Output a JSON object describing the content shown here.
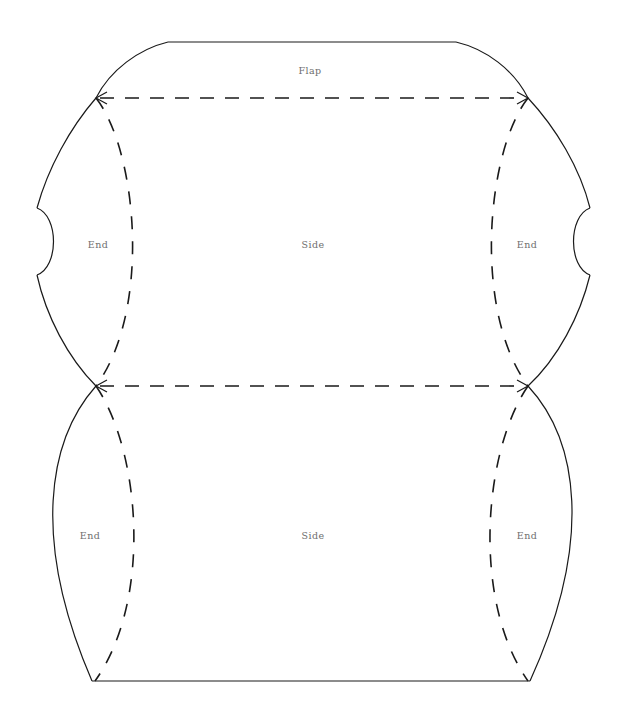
{
  "document": {
    "title": "Pillow Box Die-Cut Template",
    "background_color": "#ffffff",
    "cut_line_color": "#1a1a1a",
    "fold_line_color": "#1a1a1a",
    "label_color": "#6e6e6e",
    "width": 622,
    "height": 717
  },
  "labels": {
    "flap": "Flap",
    "side_top": "Side",
    "side_bottom": "Side",
    "end_top_left": "End",
    "end_top_right": "End",
    "end_bottom_left": "End",
    "end_bottom_right": "End"
  },
  "geometry": {
    "flap_top_left_x": 168,
    "flap_top_left_y": 42,
    "flap_top_right_x": 456,
    "flap_top_right_y": 42,
    "fold_top_left_x": 96,
    "fold_top_left_y": 98,
    "fold_top_right_x": 528,
    "fold_top_right_y": 98,
    "waist_left_x": 96,
    "waist_left_y": 386,
    "waist_right_x": 528,
    "waist_right_y": 386,
    "bottom_left_x": 92,
    "bottom_left_y": 681,
    "bottom_right_x": 530,
    "bottom_right_y": 681,
    "notch_left_x": 37,
    "notch_right_x": 590,
    "notch_top_y": 208,
    "notch_bottom_y": 275
  }
}
